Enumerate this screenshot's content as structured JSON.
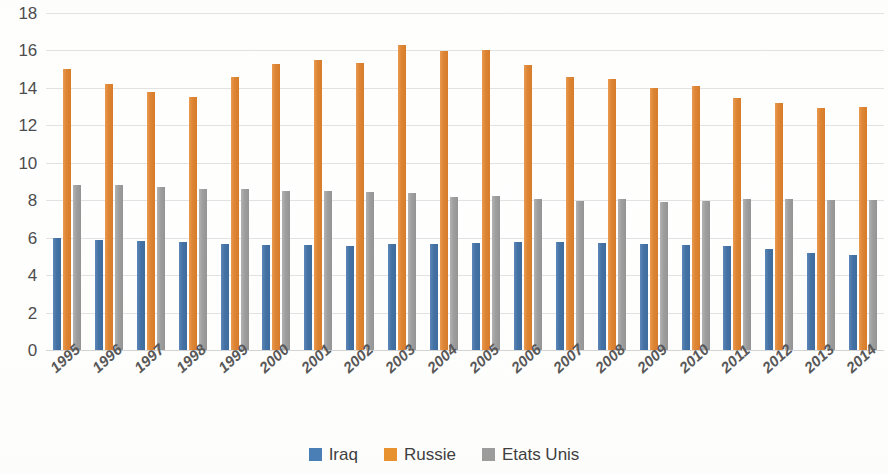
{
  "chart_data": {
    "type": "bar",
    "title": "",
    "subtitle": "",
    "xlabel": "",
    "ylabel": "",
    "ylim": [
      0,
      18
    ],
    "y_ticks": [
      18,
      16,
      14,
      12,
      10,
      8,
      6,
      4,
      2,
      0
    ],
    "grid": true,
    "legend_position": "bottom",
    "categories": [
      "1995",
      "1996",
      "1997",
      "1998",
      "1999",
      "2000",
      "2001",
      "2002",
      "2003",
      "2004",
      "2005",
      "2006",
      "2007",
      "2008",
      "2009",
      "2010",
      "2011",
      "2012",
      "2013",
      "2014"
    ],
    "series": [
      {
        "name": "Iraq",
        "color": "#4472A4",
        "values": [
          6.0,
          5.9,
          5.8,
          5.75,
          5.65,
          5.6,
          5.6,
          5.55,
          5.65,
          5.65,
          5.7,
          5.75,
          5.75,
          5.7,
          5.65,
          5.6,
          5.55,
          5.4,
          5.2,
          5.1
        ]
      },
      {
        "name": "Russie",
        "color": "#ED7D31",
        "values": [
          15.0,
          14.2,
          13.8,
          13.5,
          14.6,
          15.3,
          15.5,
          15.35,
          16.3,
          15.95,
          16.0,
          15.2,
          14.6,
          14.45,
          14.0,
          14.1,
          13.45,
          13.2,
          12.9,
          13.0
        ]
      },
      {
        "name": "Etats Unis",
        "color": "#A5A5A5",
        "values": [
          8.8,
          8.8,
          8.7,
          8.6,
          8.6,
          8.5,
          8.5,
          8.45,
          8.4,
          8.15,
          8.25,
          8.05,
          7.95,
          8.05,
          7.9,
          7.95,
          8.05,
          8.05,
          8.0,
          8.0
        ]
      }
    ]
  },
  "legend": {
    "items": [
      {
        "label": "Iraq",
        "swatch": "iraq"
      },
      {
        "label": "Russie",
        "swatch": "russie"
      },
      {
        "label": "Etats Unis",
        "swatch": "etats"
      }
    ]
  }
}
